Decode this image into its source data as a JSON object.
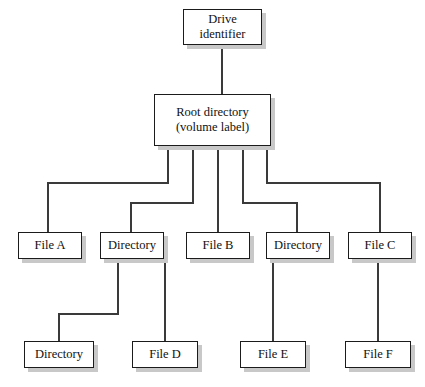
{
  "diagram": {
    "type": "tree",
    "background_color": "#ffffff",
    "box_fill": "#ffffff",
    "box_border_color": "#1b1b1b",
    "box_shadow_color": "#c8c8c8",
    "line_color": "#3a3a3a",
    "text_color": "#111111",
    "nodes": [
      {
        "id": "drive",
        "label": "Drive\nidentifier",
        "level": 0,
        "x": 183,
        "y": 9,
        "w": 79,
        "h": 36
      },
      {
        "id": "root",
        "label": "Root directory\n(volume label)",
        "level": 1,
        "x": 154,
        "y": 94,
        "w": 117,
        "h": 52
      },
      {
        "id": "file_a",
        "label": "File A",
        "level": 2,
        "x": 18,
        "y": 232,
        "w": 64,
        "h": 27
      },
      {
        "id": "dir_1",
        "label": "Directory",
        "level": 2,
        "x": 100,
        "y": 232,
        "w": 64,
        "h": 27
      },
      {
        "id": "file_b",
        "label": "File B",
        "level": 2,
        "x": 186,
        "y": 232,
        "w": 64,
        "h": 27
      },
      {
        "id": "dir_2",
        "label": "Directory",
        "level": 2,
        "x": 266,
        "y": 232,
        "w": 64,
        "h": 27
      },
      {
        "id": "file_c",
        "label": "File C",
        "level": 2,
        "x": 348,
        "y": 232,
        "w": 64,
        "h": 27
      },
      {
        "id": "dir_3",
        "label": "Directory",
        "level": 3,
        "x": 24,
        "y": 341,
        "w": 70,
        "h": 27
      },
      {
        "id": "file_d",
        "label": "File D",
        "level": 3,
        "x": 132,
        "y": 341,
        "w": 66,
        "h": 27
      },
      {
        "id": "file_e",
        "label": "File E",
        "level": 3,
        "x": 240,
        "y": 341,
        "w": 66,
        "h": 27
      },
      {
        "id": "file_f",
        "label": "File F",
        "level": 3,
        "x": 345,
        "y": 341,
        "w": 66,
        "h": 27
      }
    ],
    "edges": [
      {
        "id": "drive-root",
        "from": "drive",
        "to": "root",
        "kind": "straight"
      },
      {
        "id": "root-file-a",
        "from": "root",
        "to": "file_a",
        "kind": "elbow"
      },
      {
        "id": "root-dir-1",
        "from": "root",
        "to": "dir_1",
        "kind": "elbow"
      },
      {
        "id": "root-file-b",
        "from": "root",
        "to": "file_b",
        "kind": "straight"
      },
      {
        "id": "root-dir-2",
        "from": "root",
        "to": "dir_2",
        "kind": "elbow"
      },
      {
        "id": "root-file-c",
        "from": "root",
        "to": "file_c",
        "kind": "elbow"
      },
      {
        "id": "dir-1-dir-3",
        "from": "dir_1",
        "to": "dir_3",
        "kind": "elbow"
      },
      {
        "id": "dir-1-file-d",
        "from": "dir_1",
        "to": "file_d",
        "kind": "straight"
      },
      {
        "id": "dir-2-file-e",
        "from": "dir_2",
        "to": "file_e",
        "kind": "straight"
      },
      {
        "id": "file-c-file-f",
        "from": "file_c",
        "to": "file_f",
        "kind": "straight"
      }
    ]
  }
}
